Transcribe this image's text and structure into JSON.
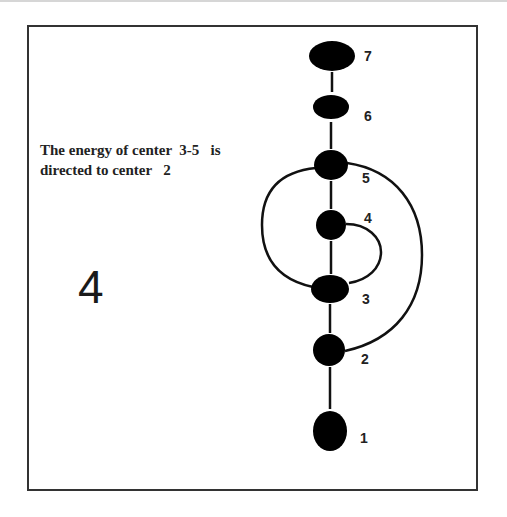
{
  "caption": {
    "line1": "The energy of center  3-5   is",
    "line2": "directed to center   2"
  },
  "figure_number": "4",
  "colors": {
    "node_fill": "#000000",
    "line": "#111111",
    "frame": "#333333"
  },
  "nodes": [
    {
      "id": "7",
      "label": "7"
    },
    {
      "id": "6",
      "label": "6"
    },
    {
      "id": "5",
      "label": "5"
    },
    {
      "id": "4",
      "label": "4"
    },
    {
      "id": "3",
      "label": "3"
    },
    {
      "id": "2",
      "label": "2"
    },
    {
      "id": "1",
      "label": "1"
    }
  ],
  "edges": [
    {
      "from": "7",
      "to": "6",
      "type": "straight"
    },
    {
      "from": "6",
      "to": "5",
      "type": "straight"
    },
    {
      "from": "5",
      "to": "4",
      "type": "straight"
    },
    {
      "from": "4",
      "to": "3",
      "type": "straight"
    },
    {
      "from": "3",
      "to": "2",
      "type": "straight"
    },
    {
      "from": "2",
      "to": "1",
      "type": "straight"
    },
    {
      "from": "5",
      "to": "3",
      "type": "curve-left"
    },
    {
      "from": "4",
      "to": "3",
      "type": "curve-right-inner"
    },
    {
      "from": "5",
      "to": "2",
      "type": "curve-right-outer"
    }
  ]
}
